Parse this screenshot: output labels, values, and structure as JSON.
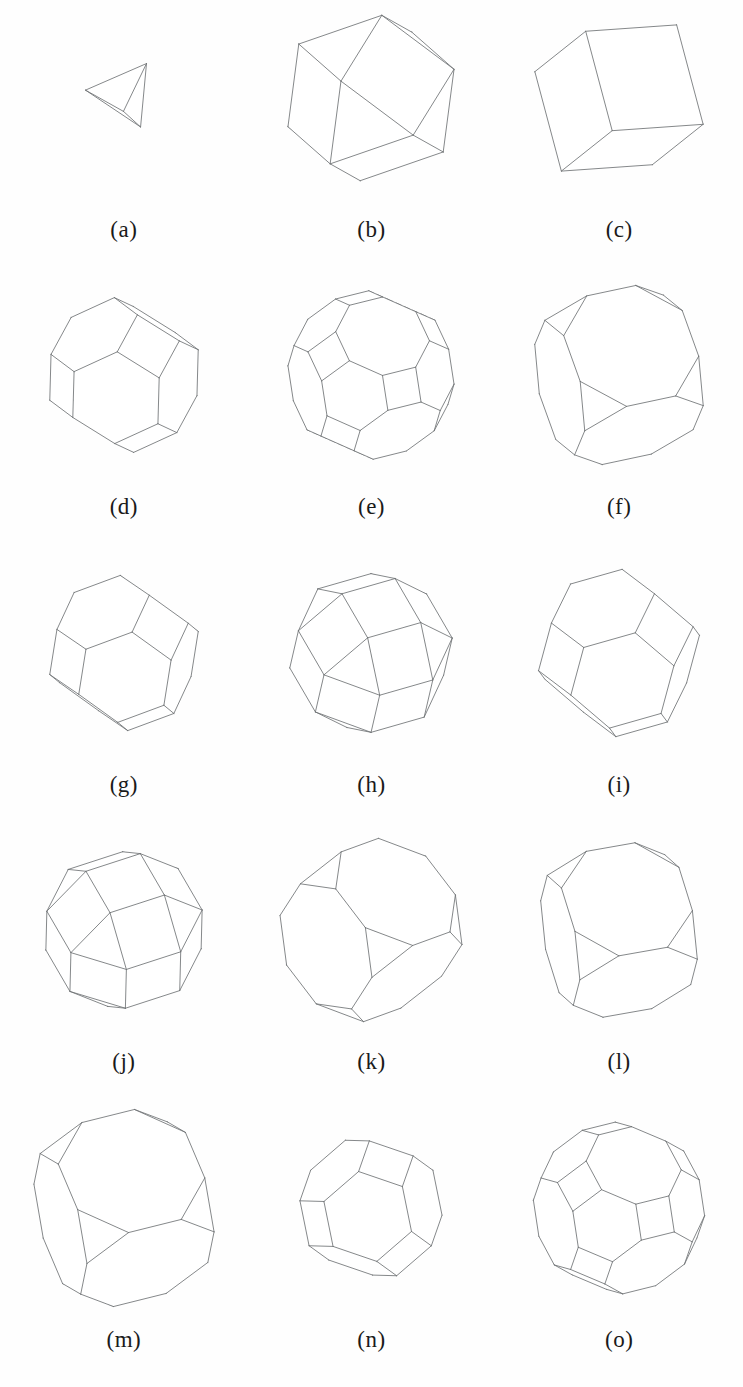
{
  "figure": {
    "kind": "polyhedra-wireframe-grid",
    "background_color": "#ffffff",
    "visible_edge_color": "#6f7275",
    "hidden_edge_color": "#8e9194",
    "label_color": "#1a1a1a",
    "columns": 3,
    "rows": 5
  },
  "panels": [
    {
      "label": "(a)",
      "name": "tetrahedron",
      "faces": "4 triangles",
      "scale": 0.42,
      "rot": [
        -22,
        34,
        8
      ],
      "solid": "tetrahedron"
    },
    {
      "label": "(b)",
      "name": "cuboctahedron",
      "faces": "8 triangles, 6 squares",
      "scale": 0.92,
      "rot": [
        -18,
        28,
        6
      ],
      "solid": "cuboctahedron"
    },
    {
      "label": "(c)",
      "name": "cube",
      "faces": "6 squares",
      "scale": 0.95,
      "rot": [
        -20,
        32,
        4
      ],
      "solid": "cube"
    },
    {
      "label": "(d)",
      "name": "truncated-octahedron",
      "faces": "8 hexagons, 6 squares",
      "scale": 0.8,
      "rot": [
        -20,
        26,
        10
      ],
      "solid": "truncated-octahedron"
    },
    {
      "label": "(e)",
      "name": "truncated-cuboctahedron-variant-1",
      "faces": "squares, hexagons, octagons",
      "scale": 0.86,
      "rot": [
        -30,
        20,
        14
      ],
      "solid": "truncated-cuboctahedron"
    },
    {
      "label": "(f)",
      "name": "truncated-cube-variant",
      "faces": "6 octagons, 8 triangles",
      "scale": 0.94,
      "rot": [
        -24,
        18,
        12
      ],
      "solid": "truncated-cube"
    },
    {
      "label": "(g)",
      "name": "truncated-octahedron-rounded",
      "faces": "8 hexagons, 6 squares",
      "scale": 0.8,
      "rot": [
        -16,
        36,
        9
      ],
      "solid": "truncated-octahedron"
    },
    {
      "label": "(h)",
      "name": "rhombicuboctahedron-variant",
      "faces": "squares, triangles, octagons",
      "scale": 0.85,
      "rot": [
        -34,
        22,
        16
      ],
      "solid": "rhombicuboctahedron"
    },
    {
      "label": "(i)",
      "name": "truncated-octahedron-tilted",
      "faces": "8 hexagons, 6 squares",
      "scale": 0.86,
      "rot": [
        -14,
        40,
        6
      ],
      "solid": "truncated-octahedron"
    },
    {
      "label": "(j)",
      "name": "rhombicuboctahedron",
      "faces": "18 squares, 8 triangles",
      "scale": 0.84,
      "rot": [
        -38,
        16,
        18
      ],
      "solid": "rhombicuboctahedron"
    },
    {
      "label": "(k)",
      "name": "truncated-cube-elongated",
      "faces": "6 octagons, 8 triangles",
      "scale": 0.94,
      "rot": [
        -26,
        40,
        20
      ],
      "solid": "truncated-cube"
    },
    {
      "label": "(l)",
      "name": "truncated-cube-variant-2",
      "faces": "6 octagons, 8 triangles",
      "scale": 0.92,
      "rot": [
        -28,
        14,
        10
      ],
      "solid": "truncated-cube"
    },
    {
      "label": "(m)",
      "name": "truncated-cube-large",
      "faces": "6 octagons, 8 triangles",
      "scale": 1.02,
      "rot": [
        -30,
        16,
        14
      ],
      "solid": "truncated-cube"
    },
    {
      "label": "(n)",
      "name": "truncated-octahedron-small",
      "faces": "8 hexagons, 6 squares",
      "scale": 0.74,
      "rot": [
        -36,
        30,
        16
      ],
      "solid": "truncated-octahedron"
    },
    {
      "label": "(o)",
      "name": "truncated-cuboctahedron",
      "faces": "12 squares, 8 hexagons, 6 octagons",
      "scale": 0.88,
      "rot": [
        -32,
        24,
        14
      ],
      "solid": "truncated-cuboctahedron"
    }
  ]
}
